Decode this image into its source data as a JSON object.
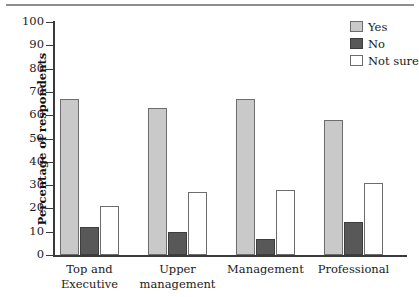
{
  "chart_data": {
    "type": "bar",
    "title": "",
    "subtitle": "",
    "xlabel": "",
    "ylabel": "Percentage of respondents",
    "ylim": [
      0,
      100
    ],
    "ytick_step": 10,
    "yticks": [
      0,
      10,
      20,
      30,
      40,
      50,
      60,
      70,
      80,
      90,
      100
    ],
    "grid": false,
    "legend_position": "top-right",
    "categories": [
      "Top and Executive",
      "Upper management",
      "Management",
      "Professional"
    ],
    "category_lines": [
      [
        "Top and",
        "Executive"
      ],
      [
        "Upper",
        "management"
      ],
      [
        "Management"
      ],
      [
        "Professional"
      ]
    ],
    "series": [
      {
        "name": "Yes",
        "color": "#c9c9c9",
        "values": [
          67,
          63,
          67,
          58
        ]
      },
      {
        "name": "No",
        "color": "#585858",
        "values": [
          12,
          10,
          7,
          14
        ]
      },
      {
        "name": "Not sure",
        "color": "#ffffff",
        "values": [
          21,
          27,
          28,
          31
        ]
      }
    ]
  },
  "legend": {
    "items": [
      {
        "label": "Yes"
      },
      {
        "label": "No"
      },
      {
        "label": "Not sure"
      }
    ]
  },
  "axis": {
    "y_title": "Percentage of respondents",
    "y_tick_labels": [
      "100",
      "90",
      "80",
      "70",
      "60",
      "50",
      "40",
      "30",
      "20",
      "10",
      "0"
    ]
  }
}
